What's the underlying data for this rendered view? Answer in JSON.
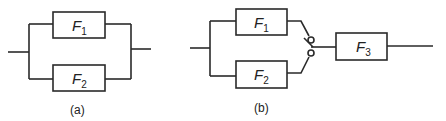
{
  "diagrams": [
    {
      "caption": "(a)",
      "blocks": [
        {
          "name": "F",
          "subscript": "1"
        },
        {
          "name": "F",
          "subscript": "2"
        }
      ],
      "topology": "parallel"
    },
    {
      "caption": "(b)",
      "blocks": [
        {
          "name": "F",
          "subscript": "1"
        },
        {
          "name": "F",
          "subscript": "2"
        },
        {
          "name": "F",
          "subscript": "3"
        }
      ],
      "topology": "parallel with switch, then series"
    }
  ],
  "colors": {
    "line": "#2a2a2a",
    "background": "#ffffff"
  }
}
